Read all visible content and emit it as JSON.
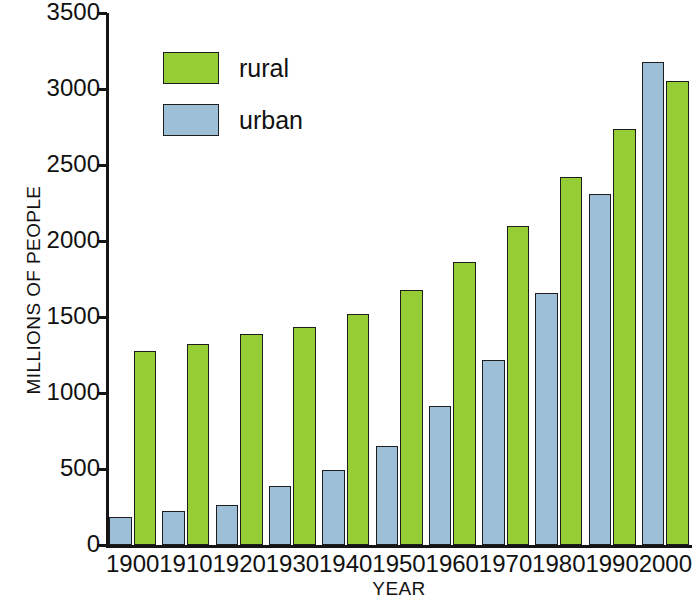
{
  "chart_data": {
    "type": "bar",
    "title": "",
    "xlabel": "YEAR",
    "ylabel": "MILLIONS OF PEOPLE",
    "categories": [
      "1900",
      "1910",
      "1920",
      "1930",
      "1940",
      "1950",
      "1960",
      "1970",
      "1980",
      "1990",
      "2000"
    ],
    "series": [
      {
        "name": "urban",
        "color": "#9dc0d8",
        "values": [
          185,
          225,
          265,
          385,
          495,
          650,
          915,
          1215,
          1660,
          2310,
          3180
        ]
      },
      {
        "name": "rural",
        "color": "#97cd34",
        "values": [
          1275,
          1320,
          1385,
          1435,
          1520,
          1680,
          1860,
          2100,
          2420,
          2740,
          3050
        ]
      }
    ],
    "ylim": [
      0,
      3500
    ],
    "yticks": [
      0,
      500,
      1000,
      1500,
      2000,
      2500,
      3000,
      3500
    ],
    "ytick_labels": [
      "0",
      "500",
      "1000",
      "1500",
      "2000",
      "2500",
      "3000",
      "3500"
    ],
    "grid": false,
    "legend_position": "top-left",
    "bar_order_within_group": [
      "urban",
      "rural"
    ]
  },
  "legend": {
    "entries": [
      {
        "label": "rural",
        "color": "#97cd34"
      },
      {
        "label": "urban",
        "color": "#9dc0d8"
      }
    ]
  },
  "axes": {
    "y_title": "MILLIONS OF PEOPLE",
    "x_title": "YEAR"
  },
  "colors": {
    "rural": "#97cd34",
    "urban": "#9dc0d8",
    "axis": "#151515",
    "outline": "#1d1d1d",
    "background": "#ffffff"
  }
}
